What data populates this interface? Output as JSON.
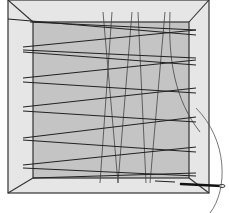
{
  "diagram": {
    "colors": {
      "frame": "#e6e6e6",
      "panel": "#c4c4c4",
      "thread": "#222222",
      "background": "#ffffff"
    },
    "frame": {
      "outer": [
        8,
        0,
        209,
        193
      ],
      "inner": [
        33,
        22,
        189,
        178
      ]
    },
    "horizontal_thread_pairs": [
      {
        "y_left": [
          20,
          22
        ],
        "y_right": [
          31,
          37
        ]
      },
      {
        "y_left": [
          48,
          52
        ],
        "y_right": [
          58,
          65
        ]
      },
      {
        "y_left": [
          78,
          83
        ],
        "y_right": [
          88,
          93
        ]
      },
      {
        "y_left": [
          107,
          112
        ],
        "y_right": [
          117,
          122
        ]
      },
      {
        "y_left": [
          135,
          140
        ],
        "y_right": [
          147,
          152
        ]
      },
      {
        "y_left": [
          165,
          168
        ],
        "y_right": [
          172,
          176
        ]
      }
    ],
    "vertical_threads": [
      {
        "top": 103,
        "bottom": 118
      },
      {
        "top": 112,
        "bottom": 100
      },
      {
        "top": 132,
        "bottom": 118
      },
      {
        "top": 138,
        "bottom": 145
      },
      {
        "top": 166,
        "bottom": 150
      },
      {
        "top": 170,
        "bottom": 160
      }
    ],
    "needle": {
      "x1": 150,
      "y1": 182,
      "x2": 226,
      "y2": 186
    }
  }
}
